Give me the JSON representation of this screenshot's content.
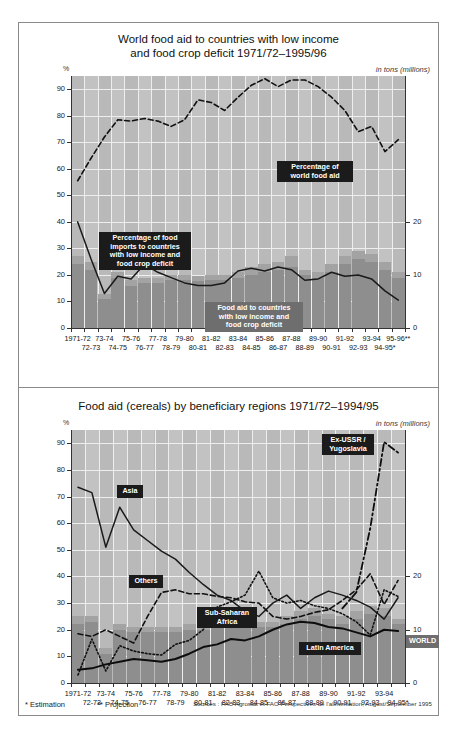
{
  "footer": {
    "estimation": "* Estimation",
    "projection": "** Projection",
    "sources": "Sources : FAO Agrostat et FAO Perspectives de l'alimentation, August/September 1995"
  },
  "chart_data": [
    {
      "type": "bar",
      "id": "top",
      "title": "World food aid to countries with low income\nand food crop deficit 1971/72–1995/96",
      "title_line1": "World food aid to countries with low income",
      "title_line2": "and food crop deficit 1971/72–1995/96",
      "ylabel": "%",
      "unit_right": "in tons (millions)",
      "ylim": [
        0,
        95
      ],
      "yticks": [
        0,
        10,
        20,
        30,
        40,
        50,
        60,
        70,
        80,
        90
      ],
      "y2lim": [
        0,
        47.5
      ],
      "y2ticks": [
        0,
        10,
        20
      ],
      "grid": true,
      "legend": "inline-callouts",
      "categories": [
        "1971-72",
        "72-73",
        "73-74",
        "74-75",
        "75-76",
        "76-77",
        "77-78",
        "78-79",
        "79-80",
        "80-81",
        "81-82",
        "82-83",
        "83-84",
        "84-85",
        "85-86",
        "86-87",
        "87-88",
        "88-89",
        "89-90",
        "90-91",
        "91-92",
        "92-93",
        "93-94",
        "94-95*",
        "95-96**"
      ],
      "xlabels_top": [
        "1971-72",
        "",
        "73-74",
        "",
        "75-76",
        "",
        "77-78",
        "",
        "79-80",
        "",
        "81-82",
        "",
        "83-84",
        "",
        "85-86",
        "",
        "87-88",
        "",
        "89-90",
        "",
        "91-92",
        "",
        "93-94",
        "",
        "95-96**"
      ],
      "xlabels_bottom": [
        "",
        "72-73",
        "",
        "74-75",
        "",
        "76-77",
        "",
        "78-79",
        "",
        "80-81",
        "",
        "82-83",
        "",
        "84-85",
        "",
        "86-87",
        "",
        "88-89",
        "",
        "90-91",
        "",
        "92-93",
        "",
        "94-95*",
        ""
      ],
      "series": [
        {
          "name": "Food aid to countries with low income and food crop deficit",
          "type": "bar-stacked",
          "axis": "right",
          "unit": "tons (millions)",
          "values_low": [
            12.0,
            11.0,
            5.5,
            9.5,
            8.0,
            8.5,
            8.5,
            9.0,
            9.0,
            8.8,
            9.0,
            9.0,
            9.5,
            10.0,
            10.5,
            11.0,
            11.5,
            10.0,
            9.5,
            10.5,
            12.0,
            13.0,
            12.5,
            11.0,
            9.5
          ],
          "values_total": [
            13.5,
            12.5,
            6.5,
            10.5,
            9.0,
            9.5,
            9.5,
            10.0,
            10.0,
            9.8,
            10.0,
            10.0,
            10.5,
            11.5,
            12.0,
            12.5,
            13.5,
            11.0,
            10.5,
            12.0,
            13.5,
            14.5,
            14.0,
            12.5,
            10.5
          ]
        },
        {
          "name": "Percentage of world food aid",
          "type": "line-dashed",
          "axis": "left",
          "unit": "%",
          "values": [
            55.5,
            64.0,
            72.0,
            78.5,
            78.0,
            79.0,
            78.0,
            76.0,
            78.5,
            86.0,
            85.0,
            82.0,
            87.0,
            91.5,
            94.0,
            91.0,
            93.5,
            93.5,
            91.0,
            87.0,
            82.0,
            74.0,
            76.0,
            66.5,
            71.0
          ]
        },
        {
          "name": "Percentage of food imports to countries with low income and food crop deficit",
          "type": "line-solid",
          "axis": "left",
          "unit": "%",
          "values": [
            40.0,
            26.0,
            13.0,
            19.5,
            18.5,
            24.0,
            21.0,
            19.0,
            17.0,
            16.0,
            16.0,
            17.0,
            21.5,
            22.5,
            21.5,
            23.0,
            22.0,
            18.0,
            18.5,
            21.0,
            19.5,
            20.0,
            18.5,
            14.0,
            10.5
          ]
        }
      ],
      "annotations": [
        {
          "label": "Percentage of\nworld food aid",
          "style": "black"
        },
        {
          "label": "Percentage of food\nimports to countries\nwith low income and\nfood crop deficit",
          "style": "black"
        },
        {
          "label": "Food aid to countries\nwith low income and\nfood crop deficit",
          "style": "grey"
        }
      ]
    },
    {
      "type": "line",
      "id": "bottom",
      "title": "Food aid (cereals) by beneficiary regions 1971/72–1994/95",
      "ylabel": "%",
      "unit_right": "in tons (millions)",
      "ylim": [
        0,
        95
      ],
      "yticks": [
        0,
        10,
        20,
        30,
        40,
        50,
        60,
        70,
        80,
        90
      ],
      "y2lim": [
        0,
        47.5
      ],
      "y2ticks": [
        0,
        10,
        20
      ],
      "grid": true,
      "categories": [
        "1971-72",
        "72-73",
        "73-74",
        "74-75",
        "75-76",
        "76-77",
        "77-78",
        "78-79",
        "79-80",
        "80-81",
        "81-82",
        "82-83",
        "83-84",
        "84-85",
        "85-86",
        "86-87",
        "87-88",
        "88-89",
        "89-90",
        "90-91",
        "91-92",
        "92-93",
        "93-94",
        "94-95*"
      ],
      "xlabels_top": [
        "1971-72",
        "",
        "73-74",
        "",
        "75-76",
        "",
        "77-78",
        "",
        "79-80",
        "",
        "81-82",
        "",
        "83-84",
        "",
        "85-86",
        "",
        "87-88",
        "",
        "89-90",
        "",
        "91-92",
        "",
        "93-94",
        ""
      ],
      "xlabels_bottom": [
        "",
        "72-73",
        "",
        "74-75",
        "",
        "76-77",
        "",
        "78-79",
        "",
        "80-81",
        "",
        "82-83",
        "",
        "84-85",
        "",
        "86-87",
        "",
        "88-89",
        "",
        "90-91",
        "",
        "92-93",
        "",
        "94-95*"
      ],
      "series": [
        {
          "name": "WORLD",
          "type": "bar-stacked",
          "axis": "right",
          "values_low": [
            11.0,
            11.5,
            5.5,
            10.0,
            9.5,
            9.5,
            9.5,
            9.5,
            10.0,
            10.0,
            10.5,
            11.0,
            11.5,
            10.5,
            10.5,
            11.0,
            12.0,
            12.5,
            12.0,
            11.0,
            12.0,
            13.0,
            12.5,
            11.0
          ],
          "values_total": [
            12.5,
            12.5,
            6.5,
            11.0,
            10.5,
            10.5,
            10.5,
            10.5,
            11.0,
            11.0,
            11.5,
            12.5,
            13.0,
            11.5,
            11.5,
            12.5,
            13.5,
            14.0,
            13.0,
            12.5,
            13.5,
            14.5,
            14.0,
            12.0
          ]
        },
        {
          "name": "Asia",
          "type": "line-solid",
          "axis": "left",
          "values": [
            73.5,
            71.5,
            51.0,
            66.0,
            57.5,
            53.5,
            49.5,
            46.5,
            41.5,
            37.0,
            33.0,
            31.0,
            27.0,
            25.0,
            30.0,
            33.0,
            28.0,
            32.0,
            34.5,
            33.0,
            31.0,
            28.5,
            24.0,
            32.0
          ]
        },
        {
          "name": "Others",
          "type": "line-dashed",
          "axis": "left",
          "values": [
            18.5,
            17.5,
            20.0,
            17.5,
            15.0,
            25.0,
            34.0,
            35.0,
            33.5,
            33.5,
            32.5,
            32.0,
            30.5,
            30.0,
            25.0,
            24.0,
            25.0,
            26.5,
            27.5,
            31.0,
            35.0,
            41.0,
            29.5,
            38.5
          ]
        },
        {
          "name": "Sub-Saharan Africa",
          "type": "line-dotted",
          "axis": "left",
          "values": [
            3.0,
            16.5,
            4.5,
            14.0,
            12.0,
            11.0,
            10.5,
            14.5,
            16.0,
            20.0,
            28.5,
            30.5,
            33.0,
            42.0,
            32.0,
            30.0,
            31.0,
            29.0,
            28.0,
            26.0,
            23.0,
            18.0,
            35.0,
            32.5
          ]
        },
        {
          "name": "Latin America",
          "type": "line-solid-thick",
          "axis": "left",
          "values": [
            5.0,
            5.5,
            7.0,
            8.0,
            9.0,
            8.5,
            8.0,
            9.0,
            11.0,
            13.5,
            14.5,
            16.5,
            16.0,
            17.5,
            20.0,
            22.0,
            23.0,
            22.5,
            21.0,
            20.5,
            19.0,
            17.5,
            20.0,
            19.5
          ]
        },
        {
          "name": "Ex-USSR / Yugoslavia",
          "type": "line-dashdot",
          "axis": "left",
          "values": [
            null,
            null,
            null,
            null,
            null,
            null,
            null,
            null,
            null,
            null,
            null,
            null,
            null,
            null,
            null,
            null,
            null,
            null,
            null,
            28.0,
            34.0,
            58.0,
            90.5,
            86.5
          ]
        }
      ],
      "annotations": [
        {
          "label": "Asia",
          "style": "black"
        },
        {
          "label": "Others",
          "style": "black"
        },
        {
          "label": "Sub-Saharan\nAfrica",
          "style": "black"
        },
        {
          "label": "Latin America",
          "style": "black"
        },
        {
          "label": "Ex-USSR /\nYugoslavia",
          "style": "black"
        },
        {
          "label": "WORLD",
          "style": "grey"
        }
      ]
    }
  ]
}
